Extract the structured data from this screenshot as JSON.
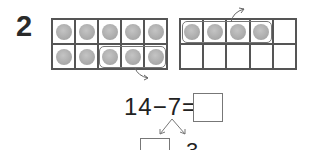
{
  "question": {
    "number": "2"
  },
  "ten_frames": [
    {
      "id": "left",
      "filled": 10,
      "rows": 2,
      "cols": 5,
      "circled_counters": 3
    },
    {
      "id": "right",
      "filled": 4,
      "rows": 2,
      "cols": 5,
      "circled_counters": 4
    }
  ],
  "equation": {
    "text": "14−7=",
    "answer_box": ""
  },
  "decomposition": {
    "left_part": "",
    "right_part": "3"
  },
  "colors": {
    "lines": "#555555",
    "counter": "#aaaaaa",
    "text": "#222222"
  }
}
